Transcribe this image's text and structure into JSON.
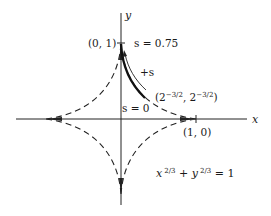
{
  "diagram": {
    "type": "astroid",
    "axes": {
      "x_label": "x",
      "y_label": "y"
    },
    "points": {
      "top": "(0, 1)",
      "right": "(1, 0)",
      "mid": "(2⁻³ᐟ², 2⁻³ᐟ²)"
    },
    "mid_label": {
      "open": "(2",
      "exp": "−3/2",
      "comma": ", 2",
      "close": ")"
    },
    "arc_labels": {
      "s_top": "s = 0.75",
      "s_mid": "s = 0",
      "direction": "+s"
    },
    "equation": {
      "x": "x",
      "exp1": "2/3",
      "plus": " + ",
      "y": "y",
      "exp2": "2/3",
      "rhs": " = 1"
    }
  }
}
